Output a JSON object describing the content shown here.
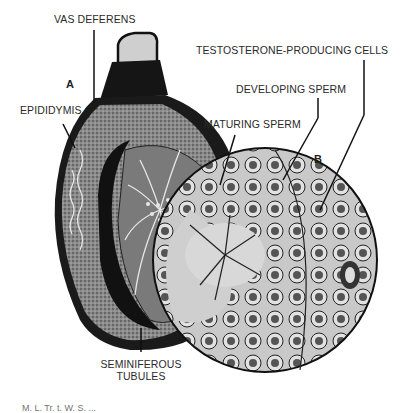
{
  "figure": {
    "panel_labels": {
      "a": "A",
      "b": "B"
    },
    "labels": {
      "vas_deferens": "VAS DEFERENS",
      "epididymis": "EPIDIDYMIS",
      "testosterone_cells": "TESTOSTERONE-PRODUCING CELLS",
      "developing_sperm": "DEVELOPING SPERM",
      "maturing_sperm": "MATURING SPERM",
      "seminiferous_line1": "SEMINIFEROUS",
      "seminiferous_line2": "TUBULES"
    },
    "caption": "M. L. Tr. t. W. S. ..."
  }
}
